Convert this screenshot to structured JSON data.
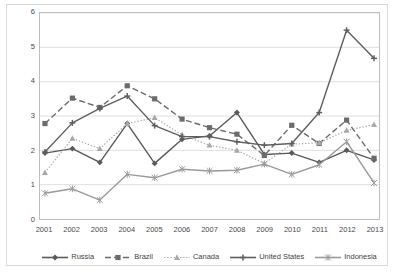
{
  "chart_data": {
    "type": "line",
    "title": "",
    "xlabel": "",
    "ylabel": "Million hectares",
    "categories": [
      "2001",
      "2002",
      "2003",
      "2004",
      "2005",
      "2006",
      "2007",
      "2008",
      "2009",
      "2010",
      "2011",
      "2012",
      "2013"
    ],
    "ylim": [
      0,
      6
    ],
    "ytick_labels": [
      "0",
      "1",
      "2",
      "3",
      "4",
      "5",
      "6"
    ],
    "ytick_values": [
      0,
      1,
      2,
      3,
      4,
      5,
      6
    ],
    "grid": "horizontal",
    "legend_position": "bottom",
    "series": [
      {
        "name": "Russia",
        "color": "#5a5a5a",
        "marker": "diamond",
        "dash": "solid",
        "values": [
          1.92,
          2.05,
          1.65,
          2.78,
          1.62,
          2.32,
          2.42,
          3.1,
          1.88,
          1.92,
          1.65,
          2.0,
          1.72
        ]
      },
      {
        "name": "Brazil",
        "color": "#6b6b6b",
        "marker": "square",
        "dash": "dashed",
        "values": [
          2.78,
          3.52,
          3.25,
          3.88,
          3.5,
          2.91,
          2.66,
          2.47,
          1.85,
          2.73,
          2.2,
          2.88,
          1.77
        ]
      },
      {
        "name": "Canada",
        "color": "#a8a8a8",
        "marker": "triangle",
        "dash": "dotted",
        "values": [
          1.35,
          2.35,
          2.05,
          2.78,
          2.95,
          2.45,
          2.15,
          2.0,
          1.62,
          2.18,
          2.22,
          2.58,
          2.75
        ]
      },
      {
        "name": "United States",
        "color": "#5f5f5f",
        "marker": "cross",
        "dash": "solid",
        "values": [
          1.95,
          2.8,
          3.22,
          3.58,
          2.72,
          2.4,
          2.4,
          2.25,
          2.15,
          2.2,
          3.1,
          5.5,
          4.68
        ]
      },
      {
        "name": "Indonesia",
        "color": "#9a9a9a",
        "marker": "star",
        "dash": "solid",
        "values": [
          0.75,
          0.88,
          0.55,
          1.3,
          1.2,
          1.45,
          1.4,
          1.42,
          1.6,
          1.3,
          1.58,
          2.25,
          1.05
        ]
      }
    ]
  }
}
